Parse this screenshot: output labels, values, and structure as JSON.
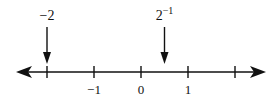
{
  "diagram": {
    "type": "number-line",
    "ticks": [
      -2,
      -1,
      0,
      1,
      2
    ],
    "tick_labels": [
      {
        "value": -1,
        "text": "−1"
      },
      {
        "value": 0,
        "text": "0"
      },
      {
        "value": 1,
        "text": "1"
      }
    ],
    "markers": [
      {
        "value": -2,
        "label_base": "−2",
        "label_exp": ""
      },
      {
        "value": 0.5,
        "label_base": "2",
        "label_exp": "−1"
      }
    ],
    "line_color": "#111111"
  }
}
